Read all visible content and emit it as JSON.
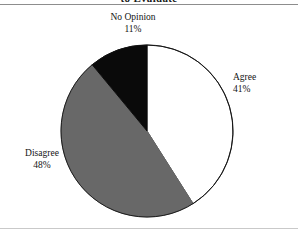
{
  "figure": {
    "title_fragment": "to Evaluate",
    "width": 298,
    "height": 230
  },
  "chart_data": {
    "type": "pie",
    "title": "to Evaluate",
    "xlabel": "",
    "ylabel": "",
    "categories": [
      "Agree",
      "Disagree",
      "No Opinion"
    ],
    "values": [
      41,
      48,
      11
    ],
    "value_unit": "percent",
    "legend_position": "none",
    "labels_inline": true,
    "start_angle_deg": 0,
    "direction": "clockwise",
    "grid": false,
    "slices": [
      {
        "label": "Agree",
        "value": 41,
        "percent_text": "41%",
        "color": "#ffffff",
        "outline": "#111111",
        "start_angle_deg": 0,
        "end_angle_deg": 147.6
      },
      {
        "label": "Disagree",
        "value": 48,
        "percent_text": "48%",
        "color": "#686868",
        "outline": "#686868",
        "start_angle_deg": 147.6,
        "end_angle_deg": 320.4
      },
      {
        "label": "No Opinion",
        "value": 11,
        "percent_text": "11%",
        "color": "#0a0a0a",
        "outline": "#0a0a0a",
        "start_angle_deg": 320.4,
        "end_angle_deg": 360
      }
    ]
  },
  "labels": {
    "no_opinion": {
      "name": "No Opinion",
      "pct": "11%"
    },
    "agree": {
      "name": "Agree",
      "pct": "41%"
    },
    "disagree": {
      "name": "Disagree",
      "pct": "48%"
    }
  }
}
